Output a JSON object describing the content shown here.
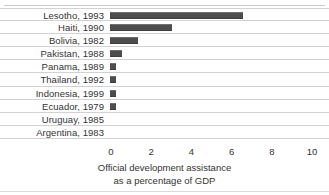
{
  "chart_data": {
    "type": "bar",
    "orientation": "horizontal",
    "title": "",
    "xlabel_lines": [
      "Official development assistance",
      "as a percentage of GDP"
    ],
    "ylabel": "",
    "xlim": [
      0,
      10
    ],
    "xticks": [
      0,
      2,
      4,
      6,
      8,
      10
    ],
    "xtick_labels": [
      "0",
      "2",
      "4",
      "6",
      "8",
      "10"
    ],
    "grid": false,
    "row_separators": true,
    "legend": "none",
    "bar_color": "#4d4d4d",
    "categories": [
      "Lesotho, 1993",
      "Haiti, 1990",
      "Bolivia, 1982",
      "Pakistan, 1988",
      "Panama, 1989",
      "Thailand, 1992",
      "Indonesia, 1999",
      "Ecuador, 1979",
      "Uruguay, 1985",
      "Argentina, 1983"
    ],
    "values": [
      6.6,
      3.1,
      1.4,
      0.6,
      0.3,
      0.3,
      0.3,
      0.3,
      0.0,
      0.0
    ]
  },
  "rows": [
    {
      "label": "Lesotho, 1993",
      "value": 6.6
    },
    {
      "label": "Haiti, 1990",
      "value": 3.1
    },
    {
      "label": "Bolivia, 1982",
      "value": 1.4
    },
    {
      "label": "Pakistan, 1988",
      "value": 0.6
    },
    {
      "label": "Panama, 1989",
      "value": 0.3
    },
    {
      "label": "Thailand, 1992",
      "value": 0.3
    },
    {
      "label": "Indonesia, 1999",
      "value": 0.3
    },
    {
      "label": "Ecuador, 1979",
      "value": 0.3
    },
    {
      "label": "Uruguay, 1985",
      "value": 0.0
    },
    {
      "label": "Argentina, 1983",
      "value": 0.0
    }
  ],
  "axis": {
    "ticks": [
      "0",
      "2",
      "4",
      "6",
      "8",
      "10"
    ],
    "caption_line1": "Official development assistance",
    "caption_line2": "as a percentage of GDP"
  }
}
